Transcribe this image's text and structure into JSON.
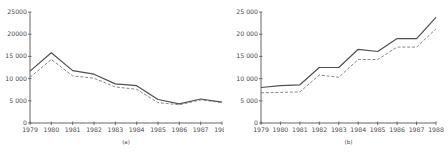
{
  "chart_data": [
    {
      "type": "line",
      "caption": "(a)",
      "title": "",
      "xlabel": "",
      "ylabel": "",
      "x": [
        "1979",
        "1980",
        "1981",
        "1982",
        "1983",
        "1984",
        "1985",
        "1986",
        "1987",
        "1988"
      ],
      "ylim": [
        0,
        25000
      ],
      "yticks": [
        0,
        5000,
        10000,
        15000,
        20000,
        25000
      ],
      "ytick_labels": [
        "0",
        "5 000",
        "10 000",
        "15 000",
        "20000",
        "25000"
      ],
      "grid": false,
      "legend": null,
      "series": [
        {
          "name": "solid",
          "style": "solid",
          "values": [
            11700,
            15800,
            11800,
            11000,
            8800,
            8400,
            5300,
            4300,
            5400,
            4700
          ]
        },
        {
          "name": "dashed",
          "style": "dashed",
          "values": [
            10300,
            14300,
            10600,
            10100,
            8100,
            7600,
            4600,
            4100,
            5200,
            4600
          ]
        }
      ]
    },
    {
      "type": "line",
      "caption": "(b)",
      "title": "",
      "xlabel": "",
      "ylabel": "",
      "x": [
        "1979",
        "1980",
        "1981",
        "1982",
        "1983",
        "1984",
        "1985",
        "1986",
        "1987",
        "1988"
      ],
      "ylim": [
        0,
        25000
      ],
      "yticks": [
        0,
        5000,
        10000,
        15000,
        20000,
        25000
      ],
      "ytick_labels": [
        "0",
        "5 000",
        "10 000",
        "15 000",
        "20 000",
        "25 000"
      ],
      "grid": false,
      "legend": null,
      "series": [
        {
          "name": "solid",
          "style": "solid",
          "values": [
            8000,
            8400,
            8600,
            12500,
            12500,
            16600,
            16100,
            19000,
            19000,
            23800
          ]
        },
        {
          "name": "dashed",
          "style": "dashed",
          "values": [
            6800,
            6900,
            7000,
            10800,
            10300,
            14300,
            14300,
            17100,
            17100,
            21200
          ]
        }
      ]
    }
  ],
  "colors": {
    "axis": "#555555",
    "solid_line": "#505050",
    "dashed_line": "#6a6a6a",
    "text": "#4a4a4a"
  }
}
